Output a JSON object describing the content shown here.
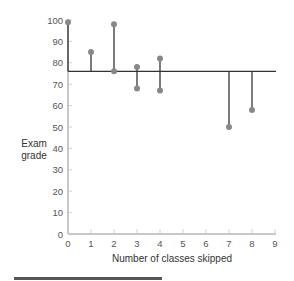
{
  "chart_data": {
    "type": "scatter",
    "title": "",
    "xlabel": "Number of classes skipped",
    "ylabel": "Exam grade",
    "xlim": [
      0,
      9
    ],
    "ylim": [
      0,
      100
    ],
    "x_ticks": [
      "0",
      "1",
      "2",
      "3",
      "4",
      "5",
      "6",
      "7",
      "8",
      "9"
    ],
    "y_ticks": [
      "0",
      "10",
      "20",
      "30",
      "40",
      "50",
      "60",
      "70",
      "80",
      "90",
      "100"
    ],
    "mean_line": 76,
    "grid": false,
    "legend": null,
    "points": [
      {
        "x": 0,
        "y": 99
      },
      {
        "x": 1,
        "y": 85
      },
      {
        "x": 2,
        "y": 98
      },
      {
        "x": 2,
        "y": 76
      },
      {
        "x": 3,
        "y": 78
      },
      {
        "x": 3,
        "y": 68
      },
      {
        "x": 4,
        "y": 82
      },
      {
        "x": 4,
        "y": 67
      },
      {
        "x": 7,
        "y": 50
      },
      {
        "x": 8,
        "y": 58
      }
    ],
    "annotations": "Vertical residual lines from each point to the horizontal mean line at 76"
  },
  "labels": {
    "ylabel_line1": "Exam",
    "ylabel_line2": "grade",
    "xlabel": "Number of classes skipped"
  }
}
